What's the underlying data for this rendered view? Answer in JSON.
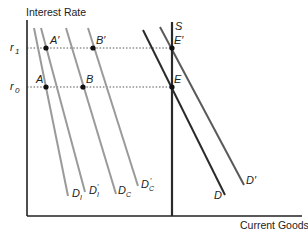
{
  "axes": {
    "y_label": "Interest Rate",
    "x_label": "Current Goods",
    "y_ticks": [
      {
        "label": "r",
        "sub": "1",
        "y": 48
      },
      {
        "label": "r",
        "sub": "0",
        "y": 87
      }
    ]
  },
  "points": [
    {
      "label": "A'",
      "x": 46,
      "y": 48
    },
    {
      "label": "B'",
      "x": 93,
      "y": 48
    },
    {
      "label": "E'",
      "x": 172,
      "y": 48
    },
    {
      "label": "A",
      "x": 46,
      "y": 87
    },
    {
      "label": "B",
      "x": 83,
      "y": 87
    },
    {
      "label": "E",
      "x": 172,
      "y": 87
    }
  ],
  "curves": {
    "gray": [
      {
        "label": "D",
        "sub": "I",
        "x1": 34,
        "y1": 28,
        "x2": 68,
        "y2": 196
      },
      {
        "label": "D",
        "sub": "I",
        "prime": true,
        "x1": 41,
        "y1": 28,
        "x2": 85,
        "y2": 192
      },
      {
        "label": "D",
        "sub": "C",
        "x1": 66,
        "y1": 28,
        "x2": 116,
        "y2": 194
      },
      {
        "label": "D",
        "sub": "C",
        "prime": true,
        "x1": 88,
        "y1": 28,
        "x2": 138,
        "y2": 186
      }
    ],
    "dark": [
      {
        "label": "D",
        "x1": 143,
        "y1": 30,
        "x2": 225,
        "y2": 195
      },
      {
        "label": "D'",
        "x1": 160,
        "y1": 27,
        "x2": 244,
        "y2": 185
      }
    ],
    "supply": {
      "label": "S",
      "x": 172,
      "y1": 22,
      "y2": 216
    }
  },
  "labels": {
    "A_prime": "A′",
    "B_prime": "B′",
    "E_prime": "E′",
    "A": "A",
    "B": "B",
    "E": "E",
    "S": "S",
    "D": "D",
    "D_prime": "D′",
    "r": "r",
    "sub1": "1",
    "sub0": "0",
    "D_letter": "D",
    "sub_I": "I",
    "sub_C": "C",
    "prime": "′"
  },
  "colors": {
    "gray_curve": "#9a9a9a",
    "dark_curve": "#2a2a2a",
    "axis": "#222222",
    "dotted": "#444444"
  }
}
